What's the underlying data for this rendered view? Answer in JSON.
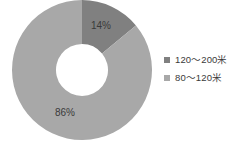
{
  "chart_data": {
    "type": "pie",
    "variant": "donut",
    "title": "",
    "subtitle": "",
    "xlabel": "",
    "ylabel": "",
    "grid": false,
    "legend_position": "right",
    "categories": [
      "120～200米",
      "80～120米"
    ],
    "values": [
      14,
      86
    ],
    "value_unit": "%",
    "data_labels": [
      "14%",
      "86%"
    ],
    "colors": [
      "#808080",
      "#a8a8a8"
    ],
    "start_angle_deg": 0,
    "direction": "clockwise",
    "inner_radius_ratio": 0.37,
    "slices": [
      {
        "name": "120～200米",
        "value": 14,
        "label": "14%",
        "color": "#808080",
        "label_x": 101,
        "label_y": 26
      },
      {
        "name": "80～120米",
        "value": 86,
        "label": "86%",
        "color": "#a8a8a8",
        "label_x": 65,
        "label_y": 113
      }
    ]
  },
  "legend": {
    "items": [
      {
        "label": "120～200米",
        "color": "#808080",
        "marker": "square-marker"
      },
      {
        "label": "80～120米",
        "color": "#a8a8a8",
        "marker": "square-marker"
      }
    ]
  },
  "geometry": {
    "center_x": 82,
    "center_y": 70,
    "outer_radius": 70,
    "inner_radius": 26
  }
}
